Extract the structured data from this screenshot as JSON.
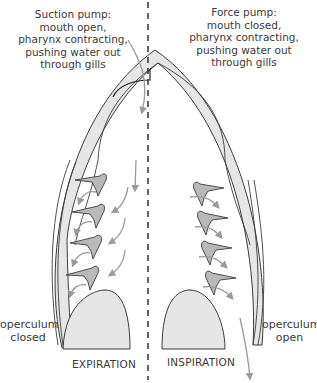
{
  "left_panel": {
    "caption": [
      "Suction pump:",
      "mouth open,",
      "pharynx contracting,",
      "pushing water out",
      "through gills"
    ],
    "operculum_label": [
      "operculum",
      "closed"
    ],
    "phase_label": "EXPIRATION"
  },
  "right_panel": {
    "caption": [
      "Force pump:",
      "mouth closed,",
      "pharynx contracting,",
      "pushing water out",
      "through gills"
    ],
    "operculum_label": [
      "operculum",
      "open"
    ],
    "phase_label": "INSPIRATION"
  },
  "colors": {
    "outline": "#3c3c3c",
    "fill_gray": "#e6e6e6",
    "gill_fill": "#b9b9b9",
    "arrow": "#9a9a9a",
    "text": "#3a3a3a"
  }
}
